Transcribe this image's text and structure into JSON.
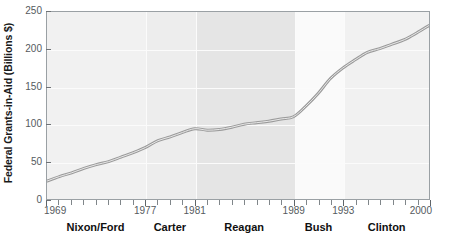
{
  "chart_data": {
    "type": "line",
    "title": "",
    "xlabel": "",
    "ylabel": "Federal Grants-in-Aid (Billions $)",
    "xlim": [
      1969,
      2000
    ],
    "ylim": [
      0,
      250
    ],
    "ytick_values": [
      0,
      50,
      100,
      150,
      200,
      250
    ],
    "ytick_labels": [
      "0",
      "50",
      "100",
      "150",
      "200",
      "250"
    ],
    "xtick_labels": [
      {
        "value": 1969,
        "label": "1969"
      },
      {
        "value": 1977,
        "label": "1977"
      },
      {
        "value": 1981,
        "label": "1981"
      },
      {
        "value": 1989,
        "label": "1989"
      },
      {
        "value": 1993,
        "label": "1993"
      },
      {
        "value": 2000,
        "label": "2000"
      }
    ],
    "xtick_minor_step": 1,
    "grid": true,
    "legend": "none",
    "line_color": "#9a9a9a",
    "line_width": 3,
    "series": [
      {
        "name": "Federal Grants-in-Aid",
        "x": [
          1969,
          1970,
          1971,
          1972,
          1973,
          1974,
          1975,
          1976,
          1977,
          1978,
          1979,
          1980,
          1981,
          1982,
          1983,
          1984,
          1985,
          1986,
          1987,
          1988,
          1989,
          1990,
          1991,
          1992,
          1993,
          1994,
          1995,
          1996,
          1997,
          1998,
          1999,
          2000
        ],
        "values": [
          24,
          30,
          35,
          41,
          46,
          50,
          56,
          62,
          69,
          78,
          83,
          89,
          94,
          92,
          93,
          96,
          100,
          102,
          104,
          107,
          110,
          124,
          141,
          161,
          175,
          186,
          196,
          201,
          207,
          213,
          222,
          232
        ]
      }
    ],
    "era_bands": [
      {
        "label": "Nixon/Ford",
        "start": 1969,
        "end": 1977,
        "shade": "#f1f1f1"
      },
      {
        "label": "Carter",
        "start": 1977,
        "end": 1981,
        "shade": "#ededed"
      },
      {
        "label": "Reagan",
        "start": 1981,
        "end": 1989,
        "shade": "#e5e5e5"
      },
      {
        "label": "Bush",
        "start": 1989,
        "end": 1993,
        "shade": "#fafafa"
      },
      {
        "label": "Clinton",
        "start": 1993,
        "end": 2000,
        "shade": "#f1f1f1"
      }
    ]
  }
}
